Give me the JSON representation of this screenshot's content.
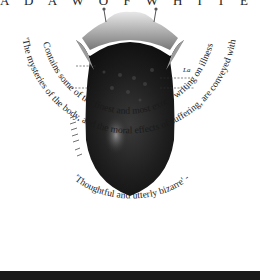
{
  "cover": {
    "top_banner": "A D A W   O F   W H I T E   S P A C E",
    "illustration": {
      "subject": "anatomical engraving of a tongue",
      "label": "La"
    },
    "quotes": [
      {
        "text": "Contains some of the finest and most exotic writing on illness and the body since Oliver Sack's ",
        "italic_title": "Awakenings"
      },
      {
        "text": "'Thoughtful and utterly bizarre' - ",
        "source": "Time Out"
      },
      {
        "text": "'The mysteries of the body, and the moral effects of suffering, are conveyed with quiet precision and compassion' - ",
        "source": "Independent"
      }
    ],
    "colors": {
      "background": "#ffffff",
      "ink": "#1a1a1a",
      "bottom_bar": "#1a1a1a"
    }
  }
}
